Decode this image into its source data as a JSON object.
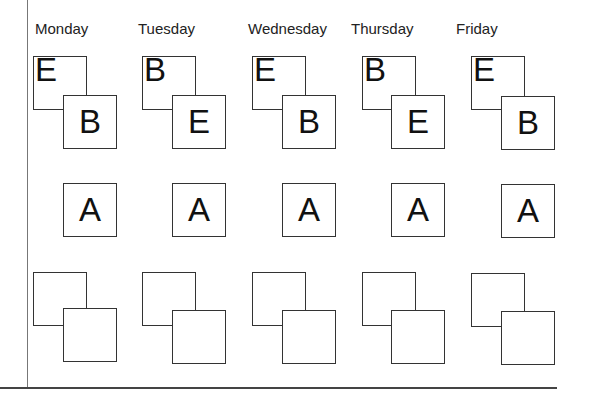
{
  "days": [
    {
      "label": "Monday",
      "x": 35,
      "col": 33,
      "top_back": "E",
      "top_front": "B",
      "middle": "A"
    },
    {
      "label": "Tuesday",
      "x": 138,
      "col": 142,
      "top_back": "B",
      "top_front": "E",
      "middle": "A"
    },
    {
      "label": "Wednesday",
      "x": 248,
      "col": 253,
      "top_back": "E",
      "top_front": "B",
      "middle": "A"
    },
    {
      "label": "Thursday",
      "x": 351,
      "col": 362,
      "top_back": "B",
      "top_front": "E",
      "middle": "A"
    },
    {
      "label": "Friday",
      "x": 456,
      "col": 472,
      "top_back": "E",
      "top_front": "B",
      "middle": "A"
    }
  ],
  "rows": {
    "top": {
      "back_y": 56,
      "front_y": 95
    },
    "middle": {
      "y": 183
    },
    "bottom": {
      "back_y": 272,
      "front_y": 309
    }
  }
}
